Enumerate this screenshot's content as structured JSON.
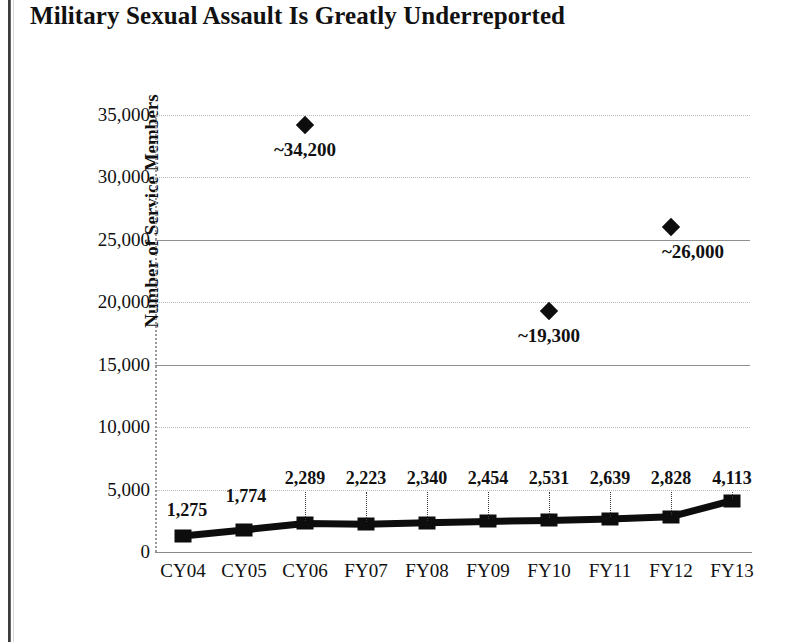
{
  "chart_data": {
    "type": "line",
    "title": "Military Sexual Assault Is Greatly Underreported",
    "xlabel": "",
    "ylabel": "Number of Service Members",
    "ylim": [
      0,
      35000
    ],
    "ytick_step": 5000,
    "grid": true,
    "legend": "none",
    "categories": [
      "CY04",
      "CY05",
      "CY06",
      "FY07",
      "FY08",
      "FY09",
      "FY10",
      "FY11",
      "FY12",
      "FY13"
    ],
    "ytick_labels": [
      "0",
      "5,000",
      "10,000",
      "15,000",
      "20,000",
      "25,000",
      "30,000",
      "35,000"
    ],
    "ytick_values": [
      0,
      5000,
      10000,
      15000,
      20000,
      25000,
      30000,
      35000
    ],
    "series": [
      {
        "name": "Reported assaults",
        "marker": "square",
        "values": [
          1275,
          1774,
          2289,
          2223,
          2340,
          2454,
          2531,
          2639,
          2828,
          4113
        ],
        "labels": [
          "1,275",
          "1,774",
          "2,289",
          "2,223",
          "2,340",
          "2,454",
          "2,531",
          "2,639",
          "2,828",
          "4,113"
        ]
      },
      {
        "name": "Estimated assaults",
        "marker": "diamond",
        "points": [
          {
            "category": "CY06",
            "value": 34200,
            "label": "~34,200"
          },
          {
            "category": "FY10",
            "value": 19300,
            "label": "~19,300"
          },
          {
            "category": "FY12",
            "value": 26000,
            "label": "~26,000"
          }
        ]
      }
    ]
  },
  "colors": {
    "series": "#0d0d0d",
    "gridline": "#b9b9b9",
    "axis": "#8a8a8a",
    "background": "#ffffff",
    "text": "#111111"
  }
}
